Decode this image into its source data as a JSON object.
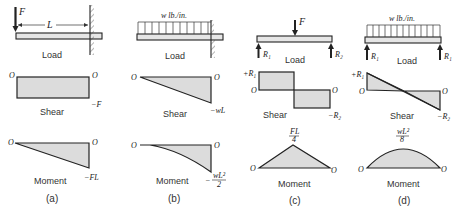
{
  "figure": {
    "panels": [
      {
        "id": "a",
        "caption": "(a)",
        "load": {
          "label": "Load",
          "force": "F",
          "span": "L",
          "support": "fixed-wall"
        },
        "shear": {
          "label": "Shear",
          "left_value": "O",
          "right_value": "O",
          "min_value": "−F"
        },
        "moment": {
          "label": "Moment",
          "left_value": "O",
          "right_value": "O",
          "min_value": "−FL"
        }
      },
      {
        "id": "b",
        "caption": "(b)",
        "load": {
          "label": "Load",
          "distributed": "w lb./in.",
          "support": "fixed-wall"
        },
        "shear": {
          "label": "Shear",
          "left_value": "O",
          "right_value": "O",
          "min_value": "−wL"
        },
        "moment": {
          "label": "Moment",
          "left_value": "O",
          "right_value": "O",
          "min_value_sign": "−",
          "min_value_num": "wL²",
          "min_value_den": "2"
        }
      },
      {
        "id": "c",
        "caption": "(c)",
        "load": {
          "label": "Load",
          "force": "F",
          "reaction_left": "R₁",
          "reaction_right": "R₂"
        },
        "shear": {
          "label": "Shear",
          "max_value": "+R₁",
          "left_value": "O",
          "right_value": "O",
          "min_value": "−R₂"
        },
        "moment": {
          "label": "Moment",
          "left_value": "O",
          "right_value": "O",
          "max_value_num": "FL",
          "max_value_den": "4"
        }
      },
      {
        "id": "d",
        "caption": "(d)",
        "load": {
          "label": "Load",
          "distributed": "w lb./in.",
          "reaction_left": "R₁",
          "reaction_right": "R₁"
        },
        "shear": {
          "label": "Shear",
          "max_value": "+R₁",
          "left_value": "O",
          "right_value": "O",
          "min_value": "−R₂"
        },
        "moment": {
          "label": "Moment",
          "left_value": "O",
          "right_value": "O",
          "max_value_num": "wL²",
          "max_value_den": "8"
        }
      }
    ]
  }
}
